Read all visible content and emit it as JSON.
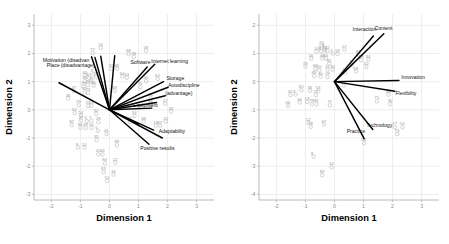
{
  "figure": {
    "type": "two-panel-biplot",
    "background": "#ffffff",
    "point_color": "#b5b5b5",
    "vector_color": "#000000",
    "grid_color": "#d9d9d9",
    "axis_color": "#a8a8a8"
  },
  "chart_data": [
    {
      "panel": "left",
      "type": "scatter",
      "title": "",
      "xlabel": "Dimension 1",
      "ylabel": "Dimension 2",
      "xlim": [
        -2.6,
        3.6
      ],
      "ylim": [
        -3.2,
        3.4
      ],
      "xticks": [
        -2,
        -1,
        0,
        1,
        2,
        3
      ],
      "xticklabels": [
        "-2",
        "-1",
        "0",
        "1",
        "2",
        "3"
      ],
      "yticks": [
        -3,
        -2,
        -1,
        0,
        1,
        2,
        3
      ],
      "yticklabels": [
        "-3",
        "-2",
        "-1",
        "0",
        "1",
        "2",
        "3"
      ],
      "grid": true,
      "legend": "none",
      "vectors": [
        {
          "label": "Motivation (disadvan",
          "x": -0.62,
          "y": 1.88,
          "label_x": -2.3,
          "label_y": 1.7,
          "anchor": "start"
        },
        {
          "label": "Place (disadvantage)",
          "x": -0.5,
          "y": 1.86,
          "label_x": -2.16,
          "label_y": 1.52,
          "anchor": "start"
        },
        {
          "label": "Software",
          "x": 1.3,
          "y": 1.52,
          "label_x": 0.72,
          "label_y": 1.62,
          "anchor": "start"
        },
        {
          "label": "Internet learning",
          "x": 1.56,
          "y": 1.62,
          "label_x": 1.44,
          "label_y": 1.66,
          "anchor": "start"
        },
        {
          "label": "Storage",
          "x": 1.86,
          "y": 1.0,
          "label_x": 1.96,
          "label_y": 1.06,
          "anchor": "start"
        },
        {
          "label": "Autodiscipline",
          "x": 2.02,
          "y": 0.8,
          "label_x": 2.02,
          "label_y": 0.82,
          "anchor": "start"
        },
        {
          "label": "(advantage)",
          "x": 1.92,
          "y": 0.5,
          "label_x": 1.92,
          "label_y": 0.54,
          "anchor": "start"
        },
        {
          "label": "Equipment",
          "x": 1.46,
          "y": 0.06,
          "label_x": 0.82,
          "label_y": 0.1,
          "anchor": "start"
        },
        {
          "label": "Adaptability",
          "x": 1.82,
          "y": -1.0,
          "label_x": 1.7,
          "label_y": -0.82,
          "anchor": "start"
        },
        {
          "label": "Positive results",
          "x": 1.36,
          "y": -1.22,
          "label_x": 1.06,
          "label_y": -1.42,
          "anchor": "start"
        },
        {
          "label": "",
          "x": -1.74,
          "y": 0.96,
          "label_x": -1.74,
          "label_y": 0.96,
          "anchor": "start"
        },
        {
          "label": "",
          "x": -0.3,
          "y": 1.9,
          "label_x": -0.3,
          "label_y": 1.9,
          "anchor": "start"
        },
        {
          "label": "",
          "x": 0.18,
          "y": 1.92,
          "label_x": 0.18,
          "label_y": 1.92,
          "anchor": "start"
        },
        {
          "label": "",
          "x": 1.62,
          "y": 0.26,
          "label_x": 1.62,
          "label_y": 0.26,
          "anchor": "start"
        },
        {
          "label": "",
          "x": 1.0,
          "y": -0.52,
          "label_x": 1.0,
          "label_y": -0.52,
          "anchor": "start"
        },
        {
          "label": "",
          "x": 1.52,
          "y": -0.72,
          "label_x": 1.52,
          "label_y": -0.72,
          "anchor": "start"
        }
      ],
      "points": [
        {
          "id": "14",
          "x": -0.3,
          "y": 2.2
        },
        {
          "id": "77",
          "x": -0.58,
          "y": 2.02
        },
        {
          "id": "68",
          "x": 0.66,
          "y": 1.98
        },
        {
          "id": "59",
          "x": 1.26,
          "y": 2.1
        },
        {
          "id": "28",
          "x": 0.84,
          "y": 1.88
        },
        {
          "id": "31",
          "x": 0.06,
          "y": 1.46
        },
        {
          "id": "46",
          "x": 0.26,
          "y": 1.46
        },
        {
          "id": "64",
          "x": 0.44,
          "y": 1.18
        },
        {
          "id": "43",
          "x": 0.6,
          "y": 1.14
        },
        {
          "id": "63",
          "x": -0.84,
          "y": 1.22
        },
        {
          "id": "67",
          "x": -0.7,
          "y": 1.14
        },
        {
          "id": "74",
          "x": -0.46,
          "y": 1.16
        },
        {
          "id": "9",
          "x": -0.56,
          "y": 1.26
        },
        {
          "id": "65",
          "x": -0.84,
          "y": 1.02
        },
        {
          "id": "75",
          "x": -0.62,
          "y": 1.0
        },
        {
          "id": "60",
          "x": 1.26,
          "y": 1.02
        },
        {
          "id": "62",
          "x": 1.66,
          "y": 1.1
        },
        {
          "id": "26",
          "x": -0.74,
          "y": 0.88
        },
        {
          "id": "80",
          "x": -0.54,
          "y": 0.86
        },
        {
          "id": "79",
          "x": -0.9,
          "y": 0.82
        },
        {
          "id": "89",
          "x": 0.18,
          "y": 0.68
        },
        {
          "id": "76",
          "x": 1.06,
          "y": 0.8
        },
        {
          "id": "47",
          "x": -1.22,
          "y": 0.66
        },
        {
          "id": "52",
          "x": -0.86,
          "y": 0.62
        },
        {
          "id": "73",
          "x": -0.74,
          "y": 0.6
        },
        {
          "id": "58",
          "x": 1.42,
          "y": 0.42
        },
        {
          "id": "36",
          "x": -1.42,
          "y": 0.4
        },
        {
          "id": "29",
          "x": -1.06,
          "y": 0.16
        },
        {
          "id": "15",
          "x": -0.74,
          "y": 0.14
        },
        {
          "id": "13",
          "x": -0.62,
          "y": 0.14
        },
        {
          "id": "17",
          "x": 1.92,
          "y": 0.22
        },
        {
          "id": "66",
          "x": 1.42,
          "y": 0.16
        },
        {
          "id": "33",
          "x": 2.12,
          "y": -0.06
        },
        {
          "id": "61",
          "x": -1.2,
          "y": -0.12
        },
        {
          "id": "54",
          "x": -0.98,
          "y": -0.2
        },
        {
          "id": "32",
          "x": -0.46,
          "y": -0.14
        },
        {
          "id": "34",
          "x": 0.86,
          "y": -0.22
        },
        {
          "id": "71",
          "x": 0.7,
          "y": -0.44
        },
        {
          "id": "68b",
          "x": 1.18,
          "y": -0.42
        },
        {
          "id": "20",
          "x": 1.94,
          "y": -0.42
        },
        {
          "id": "19",
          "x": 1.6,
          "y": -0.56
        },
        {
          "id": "67b",
          "x": 1.74,
          "y": -0.56
        },
        {
          "id": "27",
          "x": -0.98,
          "y": -0.38
        },
        {
          "id": "3",
          "x": -0.78,
          "y": -0.4
        },
        {
          "id": "7",
          "x": -0.62,
          "y": -0.38
        },
        {
          "id": "28b",
          "x": -0.38,
          "y": -0.44
        },
        {
          "id": "82",
          "x": -1.3,
          "y": -0.54
        },
        {
          "id": "86",
          "x": -1.0,
          "y": -0.64
        },
        {
          "id": "49",
          "x": -0.82,
          "y": -0.64
        },
        {
          "id": "50",
          "x": -0.62,
          "y": -0.64
        },
        {
          "id": "5",
          "x": -0.4,
          "y": -0.74
        },
        {
          "id": "41",
          "x": -0.1,
          "y": -0.86
        },
        {
          "id": "35",
          "x": -0.44,
          "y": -1.08
        },
        {
          "id": "9b",
          "x": -1.08,
          "y": -1.34
        },
        {
          "id": "52b",
          "x": -0.86,
          "y": -1.34
        },
        {
          "id": "89b",
          "x": 0.26,
          "y": -1.26
        },
        {
          "id": "45",
          "x": -0.38,
          "y": -1.58
        },
        {
          "id": "44",
          "x": -0.24,
          "y": -1.58
        },
        {
          "id": "84",
          "x": -0.16,
          "y": -1.9
        },
        {
          "id": "22",
          "x": 0.2,
          "y": -1.88
        },
        {
          "id": "83",
          "x": -0.2,
          "y": -2.22
        },
        {
          "id": "16",
          "x": 0.14,
          "y": -2.3
        },
        {
          "id": "51",
          "x": -0.08,
          "y": -2.52
        }
      ]
    },
    {
      "panel": "right",
      "type": "scatter",
      "title": "",
      "xlabel": "Dimension 1",
      "ylabel": "Dimension 2",
      "xlim": [
        -2.6,
        3.6
      ],
      "ylim": [
        -4.2,
        2.4
      ],
      "xticks": [
        -2,
        -1,
        0,
        1,
        2,
        3
      ],
      "xticklabels": [
        "-2",
        "-1",
        "0",
        "1",
        "2",
        "3"
      ],
      "yticks": [
        -4,
        -3,
        -2,
        -1,
        0,
        1,
        2
      ],
      "yticklabels": [
        "-4",
        "-3",
        "-2",
        "-1",
        "0",
        "1",
        "2"
      ],
      "grid": true,
      "legend": "none",
      "vectors": [
        {
          "label": "Interaction",
          "x": 1.34,
          "y": 1.62,
          "label_x": 0.62,
          "label_y": 1.78,
          "anchor": "start"
        },
        {
          "label": "Content",
          "x": 1.7,
          "y": 1.7,
          "label_x": 1.38,
          "label_y": 1.82,
          "anchor": "start"
        },
        {
          "label": "Innovation",
          "x": 2.22,
          "y": 0.04,
          "label_x": 2.3,
          "label_y": 0.08,
          "anchor": "start"
        },
        {
          "label": "Flexibility",
          "x": 2.08,
          "y": -0.34,
          "label_x": 2.1,
          "label_y": -0.48,
          "anchor": "start"
        },
        {
          "label": "Technology",
          "x": 1.32,
          "y": -1.7,
          "label_x": 1.1,
          "label_y": -1.62,
          "anchor": "start"
        },
        {
          "label": "Practice",
          "x": 1.02,
          "y": -2.02,
          "label_x": 0.42,
          "label_y": -1.84,
          "anchor": "start"
        }
      ],
      "points": [
        {
          "id": "25",
          "x": -0.44,
          "y": 1.28
        },
        {
          "id": "9",
          "x": -0.34,
          "y": 1.16
        },
        {
          "id": "100",
          "x": -0.62,
          "y": 1.06
        },
        {
          "id": "5",
          "x": -0.46,
          "y": 1.08
        },
        {
          "id": "12",
          "x": -0.34,
          "y": 1.1
        },
        {
          "id": "22",
          "x": -0.24,
          "y": 1.08
        },
        {
          "id": "17",
          "x": 0.34,
          "y": 1.14
        },
        {
          "id": "1",
          "x": -0.06,
          "y": 1.0
        },
        {
          "id": "58",
          "x": 0.1,
          "y": 0.98
        },
        {
          "id": "87",
          "x": 0.82,
          "y": 0.96
        },
        {
          "id": "56",
          "x": -0.8,
          "y": 0.82
        },
        {
          "id": "46",
          "x": -0.42,
          "y": 0.82
        },
        {
          "id": "84",
          "x": -0.3,
          "y": 0.82
        },
        {
          "id": "33",
          "x": 0.92,
          "y": 0.76
        },
        {
          "id": "34",
          "x": 1.16,
          "y": 0.78
        },
        {
          "id": "82",
          "x": -0.18,
          "y": 0.64
        },
        {
          "id": "31",
          "x": 0.6,
          "y": 0.58
        },
        {
          "id": "42",
          "x": 1.1,
          "y": 0.52
        },
        {
          "id": "79",
          "x": -1.0,
          "y": 0.54
        },
        {
          "id": "68",
          "x": -0.66,
          "y": 0.44
        },
        {
          "id": "60",
          "x": -0.52,
          "y": 0.4
        },
        {
          "id": "15",
          "x": -0.24,
          "y": 0.42
        },
        {
          "id": "40",
          "x": -0.06,
          "y": 0.42
        },
        {
          "id": "12b",
          "x": 0.36,
          "y": 0.32
        },
        {
          "id": "69",
          "x": 0.74,
          "y": 0.36
        },
        {
          "id": "86",
          "x": -0.7,
          "y": 0.2
        },
        {
          "id": "40b",
          "x": -0.48,
          "y": 0.18
        },
        {
          "id": "29",
          "x": -0.24,
          "y": 0.16
        },
        {
          "id": "11",
          "x": 0.32,
          "y": -0.14
        },
        {
          "id": "65",
          "x": -1.14,
          "y": -0.3
        },
        {
          "id": "36",
          "x": -0.84,
          "y": -0.32
        },
        {
          "id": "53",
          "x": -0.56,
          "y": -0.34
        },
        {
          "id": "45",
          "x": -1.52,
          "y": -0.48
        },
        {
          "id": "3",
          "x": -1.34,
          "y": -0.46
        },
        {
          "id": "27",
          "x": -0.64,
          "y": -0.48
        },
        {
          "id": "48",
          "x": 1.86,
          "y": -0.46
        },
        {
          "id": "75",
          "x": 1.46,
          "y": -0.7
        },
        {
          "id": "30",
          "x": 1.92,
          "y": -0.8
        },
        {
          "id": "36b",
          "x": -1.2,
          "y": -0.74
        },
        {
          "id": "13",
          "x": -0.94,
          "y": -0.72
        },
        {
          "id": "79b",
          "x": -0.78,
          "y": -0.8
        },
        {
          "id": "81",
          "x": -0.62,
          "y": -0.8
        },
        {
          "id": "71",
          "x": -0.16,
          "y": -0.84
        },
        {
          "id": "66",
          "x": -1.6,
          "y": -0.86
        },
        {
          "id": "52",
          "x": -0.9,
          "y": -1.46
        },
        {
          "id": "78",
          "x": -0.82,
          "y": -1.6
        },
        {
          "id": "67",
          "x": -0.36,
          "y": -1.52
        },
        {
          "id": "77",
          "x": 2.08,
          "y": -1.62
        },
        {
          "id": "56b",
          "x": 2.34,
          "y": -1.62
        },
        {
          "id": "73",
          "x": 2.16,
          "y": -1.86
        },
        {
          "id": "86b",
          "x": 1.02,
          "y": -2.18
        },
        {
          "id": "8",
          "x": -0.72,
          "y": -2.66
        },
        {
          "id": "14",
          "x": -0.1,
          "y": -3.04
        },
        {
          "id": "83",
          "x": -0.42,
          "y": -3.32
        }
      ]
    }
  ]
}
